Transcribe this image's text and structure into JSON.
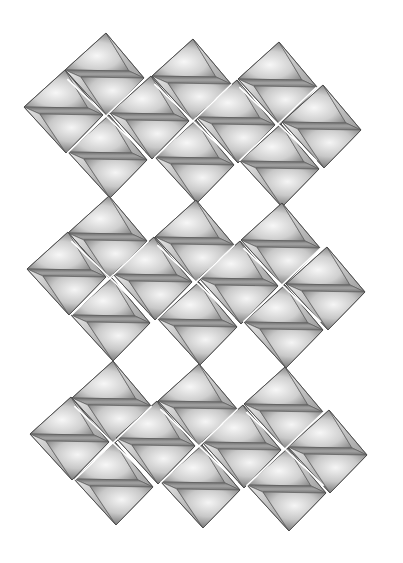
{
  "figure": {
    "title": "",
    "background": "#ffffff",
    "canvas": {
      "width": 403,
      "height": 563
    }
  },
  "style": {
    "face_light": "#f2f2f2",
    "face_mid": "#b8b8b8",
    "face_dark": "#7a7a7a",
    "band_color": "#8c8c8c",
    "sliver_color": "#d6d6d6",
    "edge_color": "#4a4a4a"
  },
  "octahedron_shape": {
    "top": [
      1,
      -42
    ],
    "left": [
      -40,
      -5
    ],
    "back": [
      24,
      -4
    ],
    "right": [
      39,
      3
    ],
    "front": [
      -24,
      2
    ],
    "bottom": [
      2,
      41
    ]
  },
  "layers": [
    {
      "name": "slab-1",
      "junctions": [
        [
          106,
          116
        ],
        [
          193,
          121
        ],
        [
          278,
          124
        ]
      ],
      "octahedra": [
        {
          "row": "upper",
          "center": [
            105,
            75
          ]
        },
        {
          "row": "upper",
          "center": [
            192,
            81
          ]
        },
        {
          "row": "upper",
          "center": [
            278,
            84
          ]
        },
        {
          "row": "middle",
          "center": [
            64,
            112
          ]
        },
        {
          "row": "middle",
          "center": [
            150,
            118
          ]
        },
        {
          "row": "middle",
          "center": [
            236,
            122
          ]
        },
        {
          "row": "middle",
          "center": [
            322,
            127
          ]
        },
        {
          "row": "lower",
          "center": [
            108,
            157
          ]
        },
        {
          "row": "lower",
          "center": [
            195,
            162
          ]
        },
        {
          "row": "lower",
          "center": [
            280,
            166
          ]
        }
      ]
    },
    {
      "name": "slab-2",
      "junctions": [
        [
          110,
          278
        ],
        [
          196,
          282
        ],
        [
          282,
          285
        ]
      ],
      "octahedra": [
        {
          "row": "upper",
          "center": [
            108,
            238
          ]
        },
        {
          "row": "upper",
          "center": [
            195,
            242
          ]
        },
        {
          "row": "upper",
          "center": [
            281,
            245
          ]
        },
        {
          "row": "middle",
          "center": [
            67,
            274
          ]
        },
        {
          "row": "middle",
          "center": [
            153,
            279
          ]
        },
        {
          "row": "middle",
          "center": [
            239,
            283
          ]
        },
        {
          "row": "middle",
          "center": [
            326,
            289
          ]
        },
        {
          "row": "lower",
          "center": [
            111,
            320
          ]
        },
        {
          "row": "lower",
          "center": [
            198,
            324
          ]
        },
        {
          "row": "lower",
          "center": [
            284,
            327
          ]
        }
      ]
    },
    {
      "name": "slab-3",
      "junctions": [
        [
          113,
          443
        ],
        [
          199,
          446
        ],
        [
          285,
          449
        ]
      ],
      "octahedra": [
        {
          "row": "upper",
          "center": [
            112,
            403
          ]
        },
        {
          "row": "upper",
          "center": [
            198,
            406
          ]
        },
        {
          "row": "upper",
          "center": [
            284,
            409
          ]
        },
        {
          "row": "middle",
          "center": [
            70,
            439
          ]
        },
        {
          "row": "middle",
          "center": [
            156,
            443
          ]
        },
        {
          "row": "middle",
          "center": [
            242,
            447
          ]
        },
        {
          "row": "middle",
          "center": [
            328,
            452
          ]
        },
        {
          "row": "lower",
          "center": [
            114,
            484
          ]
        },
        {
          "row": "lower",
          "center": [
            201,
            487
          ]
        },
        {
          "row": "lower",
          "center": [
            287,
            490
          ]
        }
      ]
    }
  ]
}
